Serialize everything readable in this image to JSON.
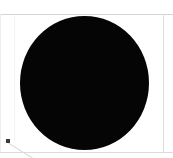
{
  "window": {
    "title": "Cropped image region",
    "width": 173,
    "height": 158,
    "background_color": "#ffffff"
  },
  "frame": {
    "top_rule_label": "top-border",
    "bottom_rule_label": "bottom-border",
    "right_rule_label": "right-border",
    "left_rule_label": "left-border",
    "rule_color": "#d9d9d9"
  },
  "canvas": {
    "label": "image-canvas",
    "background_color": "#ffffff"
  },
  "shapes": {
    "disc": {
      "name": "black-filled-circle",
      "fill_color": "#050505",
      "left": 20,
      "top": 16,
      "width": 129,
      "height": 134
    },
    "marker": {
      "name": "small-square-marker",
      "fill_color": "#3a3a3a",
      "left": 6,
      "top": 139,
      "size": 4
    },
    "leader": {
      "name": "leader-line",
      "stroke_color": "#d7d7d7",
      "angle_degrees": 32,
      "length": 34
    },
    "seam": {
      "name": "faint-vertical-seam",
      "stroke_color": "#f3f3f3"
    }
  }
}
